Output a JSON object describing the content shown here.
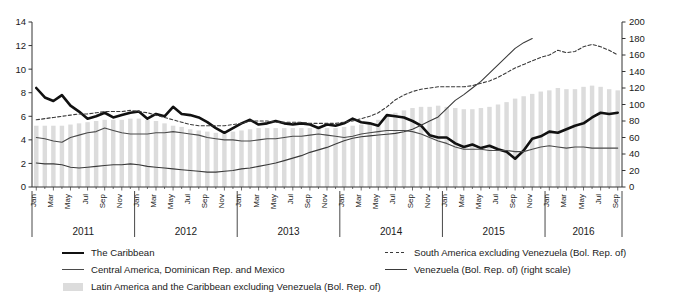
{
  "chart_data": {
    "type": "line",
    "title": "",
    "subtitle": "",
    "xlabel": "",
    "ylabel": "",
    "y2label": "",
    "grid": false,
    "legend_position": "bottom",
    "yaxis_left": {
      "min": 0,
      "max": 14,
      "step": 2,
      "ticks": [
        "0",
        "2",
        "4",
        "6",
        "8",
        "10",
        "12",
        "14"
      ]
    },
    "yaxis_right": {
      "min": 0,
      "max": 200,
      "step": 20,
      "ticks": [
        "0",
        "20",
        "40",
        "60",
        "80",
        "100",
        "120",
        "140",
        "160",
        "180",
        "200"
      ]
    },
    "x": [
      "Jan 2011",
      "Feb 2011",
      "Mar 2011",
      "Apr 2011",
      "May 2011",
      "Jun 2011",
      "Jul 2011",
      "Aug 2011",
      "Sep 2011",
      "Oct 2011",
      "Nov 2011",
      "Dec 2011",
      "Jan 2012",
      "Feb 2012",
      "Mar 2012",
      "Apr 2012",
      "May 2012",
      "Jun 2012",
      "Jul 2012",
      "Aug 2012",
      "Sep 2012",
      "Oct 2012",
      "Nov 2012",
      "Dec 2012",
      "Jan 2013",
      "Feb 2013",
      "Mar 2013",
      "Apr 2013",
      "May 2013",
      "Jun 2013",
      "Jul 2013",
      "Aug 2013",
      "Sep 2013",
      "Oct 2013",
      "Nov 2013",
      "Dec 2013",
      "Jan 2014",
      "Feb 2014",
      "Mar 2014",
      "Apr 2014",
      "May 2014",
      "Jun 2014",
      "Jul 2014",
      "Aug 2014",
      "Sep 2014",
      "Oct 2014",
      "Nov 2014",
      "Dec 2014",
      "Jan 2015",
      "Feb 2015",
      "Mar 2015",
      "Apr 2015",
      "May 2015",
      "Jun 2015",
      "Jul 2015",
      "Aug 2015",
      "Sep 2015",
      "Oct 2015",
      "Nov 2015",
      "Dec 2015",
      "Jan 2016",
      "Feb 2016",
      "Mar 2016",
      "Apr 2016",
      "May 2016",
      "Jun 2016",
      "Jul 2016",
      "Aug 2016",
      "Sep 2016"
    ],
    "month_ticks": [
      "Jan",
      "Mar",
      "May",
      "Jul",
      "Sep",
      "Nov",
      "Jan",
      "Mar",
      "May",
      "Jul",
      "Sep",
      "Nov",
      "Jan",
      "Mar",
      "May",
      "Jul",
      "Sep",
      "Nov",
      "Jan",
      "Mar",
      "May",
      "Jul",
      "Sep",
      "Nov",
      "Jan",
      "Mar",
      "May",
      "Jul",
      "Sep",
      "Nov",
      "Jan",
      "Mar",
      "May",
      "Jul",
      "Sep"
    ],
    "month_tick_index": [
      0,
      2,
      4,
      6,
      8,
      10,
      12,
      14,
      16,
      18,
      20,
      22,
      24,
      26,
      28,
      30,
      32,
      34,
      36,
      38,
      40,
      42,
      44,
      46,
      48,
      50,
      52,
      54,
      56,
      58,
      60,
      62,
      64,
      66,
      68
    ],
    "years": [
      {
        "label": "2011",
        "start_index": 0,
        "end_index": 11
      },
      {
        "label": "2012",
        "start_index": 12,
        "end_index": 23
      },
      {
        "label": "2013",
        "start_index": 24,
        "end_index": 35
      },
      {
        "label": "2014",
        "start_index": 36,
        "end_index": 47
      },
      {
        "label": "2015",
        "start_index": 48,
        "end_index": 59
      },
      {
        "label": "2016",
        "start_index": 60,
        "end_index": 68
      }
    ],
    "series": [
      {
        "name": "The Caribbean",
        "style": "thick-solid",
        "axis": "left",
        "color": "#111111",
        "values": [
          8.4,
          7.6,
          7.3,
          7.8,
          6.9,
          6.4,
          5.8,
          6.0,
          6.3,
          5.9,
          6.1,
          6.3,
          6.4,
          5.8,
          6.2,
          6.0,
          6.8,
          6.2,
          6.1,
          5.9,
          5.5,
          5.0,
          4.6,
          5.0,
          5.4,
          5.7,
          5.3,
          5.4,
          5.6,
          5.4,
          5.3,
          5.4,
          5.3,
          5.0,
          5.3,
          5.2,
          5.4,
          5.8,
          5.5,
          5.4,
          5.2,
          6.1,
          6.0,
          5.9,
          5.6,
          5.2,
          4.4,
          4.2,
          4.2,
          3.7,
          3.4,
          3.6,
          3.3,
          3.5,
          3.2,
          3.0,
          2.4,
          3.1,
          4.1,
          4.3,
          4.7,
          4.6,
          4.9,
          5.2,
          5.4,
          5.9,
          6.3,
          6.2,
          6.3
        ]
      },
      {
        "name": "Central America, Dominican Rep. and Mexico",
        "style": "thin-solid",
        "axis": "left",
        "color": "#4a4a4a",
        "values": [
          4.2,
          4.1,
          3.9,
          3.8,
          4.2,
          4.4,
          4.6,
          4.7,
          5.0,
          4.8,
          4.6,
          4.5,
          4.5,
          4.5,
          4.6,
          4.6,
          4.7,
          4.6,
          4.5,
          4.4,
          4.2,
          4.1,
          4.0,
          4.0,
          3.9,
          3.9,
          4.0,
          4.1,
          4.1,
          4.2,
          4.3,
          4.3,
          4.4,
          4.5,
          4.4,
          4.3,
          4.2,
          4.3,
          4.5,
          4.6,
          4.7,
          4.8,
          4.8,
          4.8,
          4.7,
          4.5,
          4.2,
          3.9,
          3.7,
          3.4,
          3.2,
          3.2,
          3.2,
          3.1,
          3.1,
          3.1,
          3.0,
          3.0,
          3.2,
          3.4,
          3.5,
          3.4,
          3.3,
          3.4,
          3.4,
          3.3,
          3.3,
          3.3,
          3.3
        ]
      },
      {
        "name": "South America excluding Venezuela (Bol. Rep. of)",
        "style": "dashed",
        "axis": "left",
        "color": "#3a3a3a",
        "values": [
          5.7,
          5.8,
          5.9,
          6.0,
          6.1,
          6.2,
          6.2,
          6.3,
          6.4,
          6.4,
          6.4,
          6.5,
          6.4,
          6.3,
          6.1,
          5.9,
          5.7,
          5.5,
          5.3,
          5.2,
          5.2,
          5.2,
          5.2,
          5.3,
          5.4,
          5.6,
          5.6,
          5.6,
          5.5,
          5.5,
          5.5,
          5.5,
          5.4,
          5.4,
          5.4,
          5.4,
          5.5,
          5.6,
          5.8,
          6.0,
          6.3,
          6.8,
          7.4,
          7.8,
          8.1,
          8.3,
          8.4,
          8.5,
          8.5,
          8.5,
          8.5,
          8.6,
          8.8,
          9.0,
          9.3,
          9.7,
          10.1,
          10.4,
          10.7,
          11.0,
          11.2,
          11.6,
          11.4,
          11.5,
          11.9,
          12.1,
          11.9,
          11.6,
          11.2
        ]
      },
      {
        "name": "Venezuela (Bol. Rep. of) (right scale)",
        "style": "thin-solid",
        "axis": "right",
        "color": "#3a3a3a",
        "values": [
          29,
          28,
          28,
          27,
          24,
          23,
          24,
          25,
          26,
          27,
          27,
          28,
          27,
          25,
          24,
          23,
          22,
          21,
          20,
          19,
          18,
          18,
          19,
          20,
          22,
          23,
          25,
          27,
          29,
          32,
          35,
          38,
          42,
          45,
          48,
          52,
          56,
          59,
          61,
          62,
          63,
          64,
          65,
          67,
          70,
          75,
          80,
          85,
          95,
          105,
          112,
          120,
          128,
          138,
          148,
          158,
          168,
          175,
          180,
          null,
          null,
          null,
          null,
          null,
          null,
          null,
          null,
          null,
          null
        ]
      }
    ],
    "bars": {
      "name": "Latin America and the Caribbean excluding Venezuela (Bol. Rep. of)",
      "axis": "left",
      "color": "#dcdcdc",
      "values": [
        5.2,
        5.2,
        5.2,
        5.2,
        5.3,
        5.4,
        5.5,
        5.6,
        5.7,
        5.7,
        5.7,
        5.8,
        5.8,
        5.7,
        5.6,
        5.4,
        5.2,
        5.1,
        4.9,
        4.8,
        4.7,
        4.6,
        4.6,
        4.7,
        4.8,
        4.9,
        5.0,
        5.0,
        5.0,
        5.0,
        5.0,
        5.0,
        5.0,
        5.0,
        5.0,
        5.0,
        5.1,
        5.2,
        5.3,
        5.5,
        5.7,
        6.0,
        6.3,
        6.5,
        6.7,
        6.8,
        6.8,
        6.9,
        6.8,
        6.7,
        6.6,
        6.6,
        6.7,
        6.8,
        7.0,
        7.2,
        7.5,
        7.7,
        7.9,
        8.1,
        8.2,
        8.4,
        8.3,
        8.3,
        8.5,
        8.6,
        8.5,
        8.3,
        8.2
      ]
    }
  },
  "legend": {
    "items": [
      {
        "label": "The Caribbean",
        "style": "thick-solid"
      },
      {
        "label": "Central America, Dominican Rep. and Mexico",
        "style": "thin-solid"
      },
      {
        "label": "Latin America and the Caribbean excluding Venezuela (Bol. Rep. of)",
        "style": "bar"
      },
      {
        "label": "South America excluding Venezuela (Bol. Rep. of)",
        "style": "dashed"
      },
      {
        "label": "Venezuela (Bol. Rep. of) (right scale)",
        "style": "ven-solid"
      }
    ]
  }
}
